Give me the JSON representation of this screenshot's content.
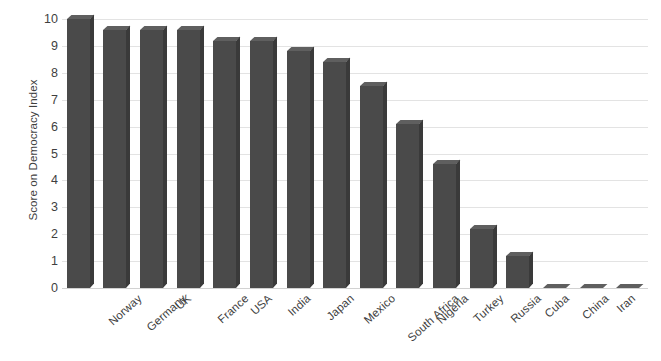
{
  "chart_data": {
    "type": "bar",
    "title": "",
    "subtitle": "",
    "xlabel": "",
    "ylabel": "Score on Democracy Index",
    "ylim": [
      0,
      10
    ],
    "y_ticks": [
      0,
      1,
      2,
      3,
      4,
      5,
      6,
      7,
      8,
      9,
      10
    ],
    "grid": "horizontal",
    "legend": "none",
    "orientation": "vertical",
    "bar_style": "3d",
    "x_label_rotation": -42,
    "categories": [
      "Norway",
      "Germany",
      "UK",
      "France",
      "USA",
      "India",
      "Japan",
      "Mexico",
      "South Africa",
      "Nigeria",
      "Turkey",
      "Russia",
      "Cuba",
      "China",
      "Iran",
      "North Korea"
    ],
    "values": [
      10.0,
      9.6,
      9.6,
      9.6,
      9.2,
      9.2,
      8.8,
      8.4,
      7.5,
      6.1,
      4.6,
      2.2,
      1.2,
      0.0,
      0.0,
      0.0
    ],
    "series": [
      {
        "name": "Democracy Index",
        "values": [
          10.0,
          9.6,
          9.6,
          9.6,
          9.2,
          9.2,
          8.8,
          8.4,
          7.5,
          6.1,
          4.6,
          2.2,
          1.2,
          0.0,
          0.0,
          0.0
        ]
      }
    ]
  },
  "colors": {
    "bar_front": "#4a4a4a",
    "bar_top": "#5f5f5f",
    "bar_side": "#3a3a3a",
    "gridline": "#e3e3e3",
    "baseline": "#d2d2d2",
    "text": "#3f3f3f",
    "background": "#ffffff"
  }
}
